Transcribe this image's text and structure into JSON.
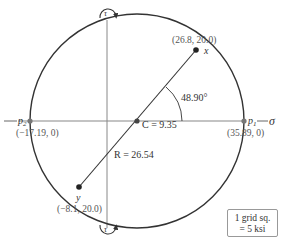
{
  "diagram": {
    "type": "mohr-circle",
    "axes": {
      "horizontal_label": "σ",
      "vertical_label_top": "τ",
      "vertical_label_bottom": "τ"
    },
    "center": {
      "label": "C = 9.35",
      "value": 9.35
    },
    "radius": {
      "label": "R = 26.54",
      "value": 26.54
    },
    "points": {
      "x": {
        "name": "x",
        "coords": "(26.8, 20.0)"
      },
      "y": {
        "name": "y",
        "coords": "(−8.1, 20.0)"
      },
      "p1": {
        "name": "p",
        "subscript": "1",
        "coords": "(35.89, 0)"
      },
      "p2": {
        "name": "p",
        "subscript": "2",
        "coords": "(−17.19, 0)"
      }
    },
    "angle": {
      "label": "48.90°"
    },
    "legend": {
      "line1": "1 grid sq.",
      "line2": "= 5 ksi"
    },
    "colors": {
      "circle": "#333333",
      "axis": "#888888",
      "diameter": "#333333",
      "point": "#222222",
      "principal_point": "#777777"
    }
  }
}
